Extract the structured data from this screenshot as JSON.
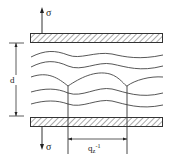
{
  "diagram": {
    "labels": {
      "stress_top": "σ",
      "stress_bottom": "σ",
      "spacing": "d",
      "wavelength": "q",
      "wavelength_sub": "z",
      "wavelength_sup": "-1"
    },
    "colors": {
      "line": "#333333",
      "hatch": "#555555",
      "background": "#ffffff"
    },
    "elements": {
      "plates": 2,
      "undulating_layers": 5
    }
  }
}
